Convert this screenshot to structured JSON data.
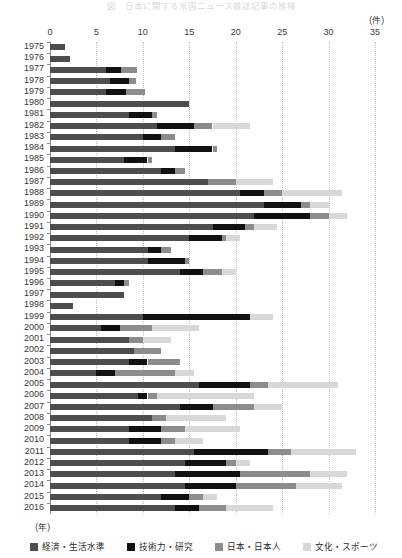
{
  "chart_data": {
    "type": "bar",
    "orientation": "horizontal",
    "stacked": true,
    "title": "図　日本に関する米国ニュース雑誌記事の推移",
    "unit_label": "(件)",
    "xlabel": "",
    "ylabel": "(年)",
    "xlim": [
      0,
      35
    ],
    "xticks": [
      0,
      5,
      10,
      15,
      20,
      25,
      30,
      35
    ],
    "grid": "vertical-dotted",
    "legend_position": "bottom",
    "colors": {
      "series_0": "#4d4d4d",
      "series_1": "#111111",
      "series_2": "#8c8c8c",
      "series_3": "#d8d8d8"
    },
    "categories": [
      "1975",
      "1976",
      "1977",
      "1978",
      "1979",
      "1980",
      "1981",
      "1982",
      "1983",
      "1984",
      "1985",
      "1986",
      "1987",
      "1988",
      "1989",
      "1990",
      "1991",
      "1992",
      "1993",
      "1994",
      "1995",
      "1996",
      "1997",
      "1998",
      "1999",
      "2000",
      "2001",
      "2002",
      "2003",
      "2004",
      "2005",
      "2006",
      "2007",
      "2008",
      "2009",
      "2010",
      "2011",
      "2012",
      "2013",
      "2014",
      "2015",
      "2016"
    ],
    "series": [
      {
        "name": "経済・生活水準",
        "values": [
          1.6,
          2.2,
          6.0,
          6.5,
          6.0,
          15.0,
          8.5,
          11.5,
          10.0,
          13.5,
          8.0,
          12.0,
          17.0,
          20.5,
          23.0,
          22.0,
          17.5,
          15.0,
          10.5,
          10.5,
          14.0,
          7.0,
          8.0,
          2.5,
          10.0,
          5.5,
          8.5,
          9.0,
          8.5,
          5.0,
          16.0,
          9.5,
          14.0,
          11.0,
          8.5,
          8.5,
          15.5,
          14.5,
          13.5,
          14.5,
          12.0,
          13.5
        ]
      },
      {
        "name": "技術力・研究",
        "values": [
          0.0,
          0.0,
          1.6,
          2.0,
          2.2,
          0.0,
          2.5,
          4.0,
          2.0,
          4.0,
          2.5,
          1.5,
          0.0,
          2.5,
          4.0,
          6.0,
          3.5,
          3.5,
          1.5,
          4.0,
          2.5,
          1.0,
          0.0,
          0.0,
          11.5,
          2.0,
          0.0,
          0.0,
          2.0,
          2.0,
          5.5,
          1.0,
          3.5,
          0.0,
          3.5,
          3.5,
          8.0,
          4.5,
          7.0,
          5.5,
          3.0,
          2.5
        ]
      },
      {
        "name": "日本・日本人",
        "values": [
          0.0,
          0.0,
          1.8,
          0.8,
          2.0,
          0.0,
          0.5,
          2.0,
          1.5,
          0.5,
          0.5,
          1.0,
          3.0,
          2.0,
          1.0,
          2.0,
          1.0,
          0.5,
          1.0,
          0.5,
          2.0,
          0.5,
          0.0,
          0.0,
          0.0,
          3.5,
          1.5,
          3.0,
          3.5,
          6.5,
          2.0,
          1.0,
          4.5,
          1.5,
          2.5,
          1.5,
          2.5,
          1.0,
          7.5,
          6.5,
          1.5,
          3.0
        ]
      },
      {
        "name": "文化・スポーツ",
        "values": [
          0.0,
          0.0,
          0.0,
          0.0,
          0.0,
          0.0,
          0.0,
          4.0,
          0.0,
          0.0,
          0.0,
          0.0,
          4.0,
          6.5,
          2.0,
          2.0,
          2.5,
          1.5,
          0.0,
          0.0,
          1.5,
          0.0,
          0.0,
          0.0,
          2.5,
          5.0,
          3.0,
          0.0,
          0.0,
          2.0,
          7.5,
          10.5,
          3.0,
          6.5,
          6.0,
          3.0,
          7.0,
          1.5,
          4.0,
          5.0,
          1.5,
          5.0
        ]
      }
    ]
  }
}
